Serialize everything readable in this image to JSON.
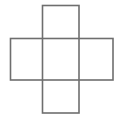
{
  "figure": {
    "canvas": {
      "width": 119,
      "height": 120,
      "background_color": "#ffffff"
    },
    "style": {
      "stroke_color": "#6e6e6e",
      "stroke_width": 1.6,
      "fill": "none"
    },
    "shapes": [
      {
        "name": "vertical-rectangle",
        "role": "vertical bar of the cross",
        "x": 42.5,
        "y": 5.5,
        "width": 36.5,
        "height": 107.5,
        "stroke_color": "#6e6e6e"
      },
      {
        "name": "horizontal-rectangle",
        "role": "horizontal bar of the cross",
        "x": 10.5,
        "y": 38.5,
        "width": 102.5,
        "height": 41.5,
        "stroke_color": "#6e6e6e"
      }
    ],
    "intersections": [
      {
        "name": "top-left-crossing",
        "x": 42.5,
        "y": 38.5
      },
      {
        "name": "top-right-crossing",
        "x": 79.0,
        "y": 38.5
      },
      {
        "name": "bottom-left-crossing",
        "x": 42.5,
        "y": 80.0
      },
      {
        "name": "bottom-right-crossing",
        "x": 79.0,
        "y": 80.0
      }
    ]
  }
}
